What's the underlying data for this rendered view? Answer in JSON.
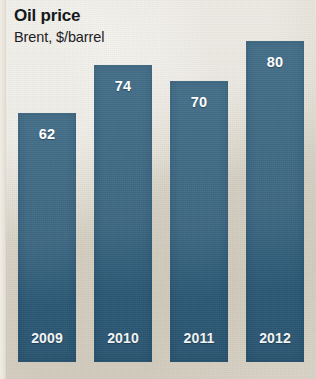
{
  "chart_data": {
    "type": "bar",
    "title": "Oil price",
    "subtitle": "Brent, $/barrel",
    "xlabel": "",
    "ylabel": "",
    "ylim": [
      0,
      88
    ],
    "grid": false,
    "legend": null,
    "categories": [
      "2009",
      "2010",
      "2011",
      "2012"
    ],
    "values": [
      62,
      74,
      70,
      80
    ],
    "series": [
      {
        "name": "Brent, $/barrel",
        "values": [
          62,
          74,
          70,
          80
        ]
      }
    ],
    "value_labels": [
      "62",
      "74",
      "70",
      "80"
    ],
    "colors": {
      "bar": "#2e5c79",
      "background": "#dedacf",
      "value_label": "#ffffff",
      "category_label": "#f2f3f2",
      "title": "#15181a"
    }
  }
}
